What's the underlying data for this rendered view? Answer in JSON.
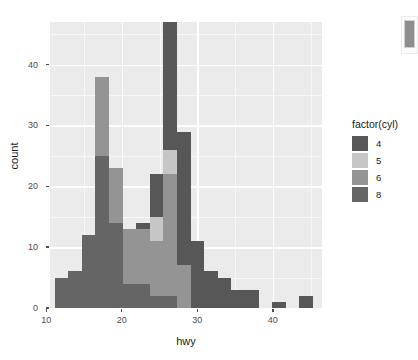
{
  "chart_data": {
    "type": "bar",
    "subtype": "stacked-histogram",
    "title": "",
    "xlabel": "hwy",
    "ylabel": "count",
    "xlim": [
      10.5,
      46.5
    ],
    "ylim": [
      0,
      47
    ],
    "xticks": [
      10,
      20,
      30,
      40
    ],
    "yticks": [
      0,
      10,
      20,
      30,
      40
    ],
    "grid": true,
    "legend_position": "right",
    "legend_title": "factor(cyl)",
    "series": [
      {
        "name": "4",
        "color": "#575757"
      },
      {
        "name": "5",
        "color": "#c6c6c6"
      },
      {
        "name": "6",
        "color": "#949494"
      },
      {
        "name": "8",
        "color": "#656565"
      }
    ],
    "bin_width": 1.8,
    "bins": [
      {
        "x": 12.0,
        "4": 0,
        "5": 0,
        "6": 0,
        "8": 5,
        "total": 5
      },
      {
        "x": 13.8,
        "4": 0,
        "5": 0,
        "6": 0,
        "8": 6,
        "total": 6
      },
      {
        "x": 15.6,
        "4": 0,
        "5": 0,
        "6": 0,
        "8": 12,
        "total": 12
      },
      {
        "x": 17.4,
        "4": 0,
        "5": 0,
        "6": 13,
        "8": 25,
        "total": 38
      },
      {
        "x": 19.2,
        "4": 0,
        "5": 0,
        "6": 9,
        "8": 14,
        "total": 23
      },
      {
        "x": 21.0,
        "4": 0,
        "5": 0,
        "6": 9,
        "8": 4,
        "total": 13
      },
      {
        "x": 22.8,
        "4": 1,
        "5": 0,
        "6": 9,
        "8": 4,
        "total": 14
      },
      {
        "x": 24.6,
        "4": 7,
        "5": 4,
        "6": 9,
        "8": 2,
        "total": 22
      },
      {
        "x": 26.4,
        "4": 21,
        "5": 4,
        "6": 20,
        "8": 2,
        "total": 47
      },
      {
        "x": 28.2,
        "4": 22,
        "5": 0,
        "6": 7,
        "8": 0,
        "total": 29
      },
      {
        "x": 30.0,
        "4": 11,
        "5": 0,
        "6": 0,
        "8": 0,
        "total": 11
      },
      {
        "x": 31.8,
        "4": 6,
        "5": 0,
        "6": 0,
        "8": 0,
        "total": 6
      },
      {
        "x": 33.6,
        "4": 5,
        "5": 0,
        "6": 0,
        "8": 0,
        "total": 5
      },
      {
        "x": 35.4,
        "4": 3,
        "5": 0,
        "6": 0,
        "8": 0,
        "total": 3
      },
      {
        "x": 37.2,
        "4": 3,
        "5": 0,
        "6": 0,
        "8": 0,
        "total": 3
      },
      {
        "x": 40.8,
        "4": 1,
        "5": 0,
        "6": 0,
        "8": 0,
        "total": 1
      },
      {
        "x": 44.4,
        "4": 2,
        "5": 0,
        "6": 0,
        "8": 0,
        "total": 2
      }
    ]
  },
  "axes": {
    "x": {
      "label": "hwy",
      "ticks": [
        "10",
        "20",
        "30",
        "40"
      ]
    },
    "y": {
      "label": "count",
      "ticks": [
        "0",
        "10",
        "20",
        "30",
        "40"
      ]
    }
  },
  "legend": {
    "title": "factor(cyl)",
    "items": [
      {
        "label": "4",
        "color": "#575757"
      },
      {
        "label": "5",
        "color": "#c6c6c6"
      },
      {
        "label": "6",
        "color": "#949494"
      },
      {
        "label": "8",
        "color": "#656565"
      }
    ]
  },
  "theme": {
    "panel_background": "#ebebeb",
    "grid_major": "#ffffff",
    "grid_minor": "#f6f6f6",
    "text_color": "#1a1a1a",
    "tick_color": "#4d4d4d",
    "plot_background": "#ffffff"
  }
}
